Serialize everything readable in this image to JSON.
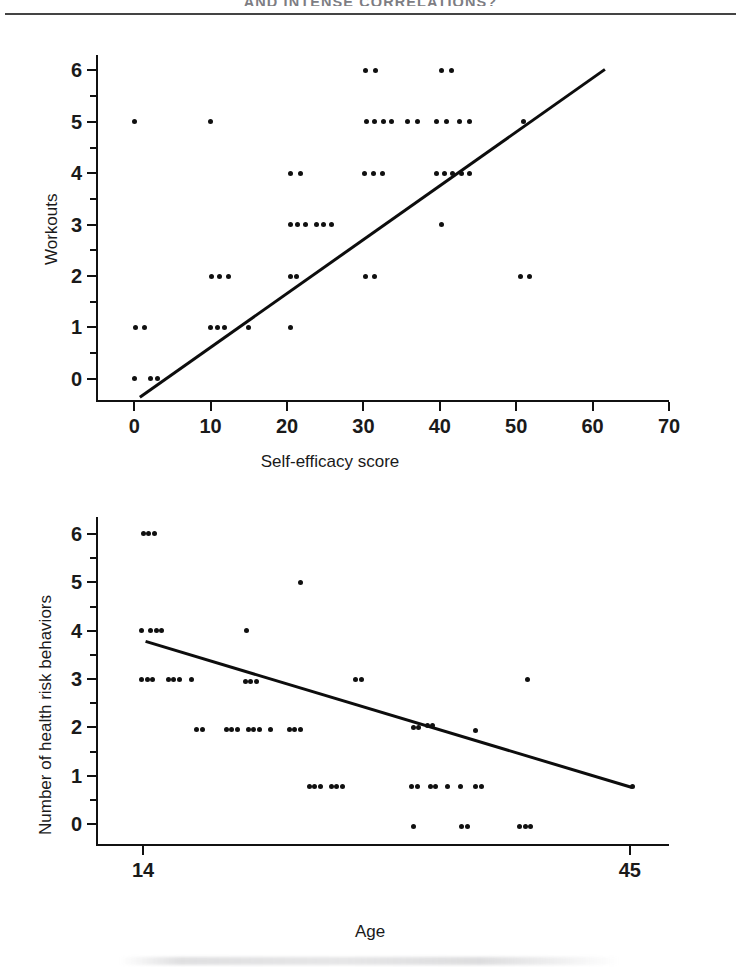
{
  "page": {
    "running_head": "AND INTENSE CORRELATIONS?",
    "background_color": "#ffffff",
    "ink_color": "#101010"
  },
  "chart_data": [
    {
      "id": "workouts-vs-self-efficacy",
      "type": "scatter",
      "title": "",
      "xlabel": "Self-efficacy score",
      "ylabel": "Workouts",
      "xlim": [
        -5,
        70
      ],
      "ylim": [
        -0.45,
        6.3
      ],
      "xticks": [
        0,
        10,
        20,
        30,
        40,
        50,
        60,
        70
      ],
      "yticks": [
        0,
        1,
        2,
        3,
        4,
        5,
        6
      ],
      "y_minor_ticks": [
        0.5,
        1.5,
        2.5,
        3.5,
        4.5,
        5.5
      ],
      "grid": false,
      "legend": false,
      "relationship": "positive",
      "trendline": {
        "type": "linear",
        "x_start": 0.6,
        "y_start": -0.33,
        "x_end": 61.5,
        "y_end": 6.05
      },
      "points": [
        {
          "x": 0,
          "y": 5
        },
        {
          "x": 10,
          "y": 5
        },
        {
          "x": 30.3,
          "y": 6
        },
        {
          "x": 31.6,
          "y": 6
        },
        {
          "x": 40.2,
          "y": 6
        },
        {
          "x": 41.5,
          "y": 6
        },
        {
          "x": 30.4,
          "y": 5
        },
        {
          "x": 31.5,
          "y": 5
        },
        {
          "x": 32.6,
          "y": 5
        },
        {
          "x": 33.7,
          "y": 5
        },
        {
          "x": 35.8,
          "y": 5
        },
        {
          "x": 37.1,
          "y": 5
        },
        {
          "x": 39.6,
          "y": 5
        },
        {
          "x": 40.9,
          "y": 5
        },
        {
          "x": 42.6,
          "y": 5
        },
        {
          "x": 43.9,
          "y": 5
        },
        {
          "x": 51.0,
          "y": 5
        },
        {
          "x": 20.5,
          "y": 4
        },
        {
          "x": 21.8,
          "y": 4
        },
        {
          "x": 30.2,
          "y": 4
        },
        {
          "x": 31.3,
          "y": 4
        },
        {
          "x": 32.5,
          "y": 4
        },
        {
          "x": 39.6,
          "y": 4
        },
        {
          "x": 40.6,
          "y": 4
        },
        {
          "x": 41.6,
          "y": 4
        },
        {
          "x": 42.9,
          "y": 4
        },
        {
          "x": 43.9,
          "y": 4
        },
        {
          "x": 20.4,
          "y": 3
        },
        {
          "x": 21.4,
          "y": 3
        },
        {
          "x": 22.4,
          "y": 3
        },
        {
          "x": 23.8,
          "y": 3
        },
        {
          "x": 24.8,
          "y": 3
        },
        {
          "x": 25.8,
          "y": 3
        },
        {
          "x": 40.2,
          "y": 3
        },
        {
          "x": 10.1,
          "y": 2
        },
        {
          "x": 11.2,
          "y": 2
        },
        {
          "x": 12.3,
          "y": 2
        },
        {
          "x": 20.4,
          "y": 2
        },
        {
          "x": 21.3,
          "y": 2
        },
        {
          "x": 30.3,
          "y": 2
        },
        {
          "x": 31.4,
          "y": 2
        },
        {
          "x": 50.6,
          "y": 2
        },
        {
          "x": 51.7,
          "y": 2
        },
        {
          "x": 0.2,
          "y": 1
        },
        {
          "x": 1.3,
          "y": 1
        },
        {
          "x": 10.0,
          "y": 1
        },
        {
          "x": 10.9,
          "y": 1
        },
        {
          "x": 11.8,
          "y": 1
        },
        {
          "x": 15.0,
          "y": 1
        },
        {
          "x": 20.5,
          "y": 1
        },
        {
          "x": 0.1,
          "y": 0
        },
        {
          "x": 2.1,
          "y": 0
        },
        {
          "x": 3.0,
          "y": 0
        }
      ]
    },
    {
      "id": "health-risk-behaviors-vs-age",
      "type": "scatter",
      "title": "",
      "xlabel": "Age",
      "ylabel": "Number of health risk behaviors",
      "xlim": [
        11.0,
        47.5
      ],
      "ylim": [
        -0.45,
        6.35
      ],
      "xticks": [
        14,
        45
      ],
      "yticks": [
        0,
        1,
        2,
        3,
        4,
        5,
        6
      ],
      "y_minor_ticks": [
        0.5,
        1.5,
        2.5,
        3.5,
        4.5,
        5.5
      ],
      "grid": false,
      "legend": false,
      "relationship": "negative",
      "trendline": {
        "type": "linear",
        "x_start": 14.2,
        "y_start": 3.8,
        "x_end": 45.2,
        "y_end": 0.78
      },
      "points": [
        {
          "x": 14.0,
          "y": 6
        },
        {
          "x": 14.35,
          "y": 6
        },
        {
          "x": 14.7,
          "y": 6
        },
        {
          "x": 24.0,
          "y": 5
        },
        {
          "x": 13.9,
          "y": 4
        },
        {
          "x": 14.5,
          "y": 4
        },
        {
          "x": 14.85,
          "y": 4
        },
        {
          "x": 15.2,
          "y": 4
        },
        {
          "x": 20.6,
          "y": 4
        },
        {
          "x": 13.9,
          "y": 3
        },
        {
          "x": 14.25,
          "y": 3
        },
        {
          "x": 14.6,
          "y": 3
        },
        {
          "x": 15.6,
          "y": 3
        },
        {
          "x": 15.95,
          "y": 3
        },
        {
          "x": 16.3,
          "y": 3
        },
        {
          "x": 17.1,
          "y": 3
        },
        {
          "x": 20.5,
          "y": 2.95
        },
        {
          "x": 20.85,
          "y": 2.95
        },
        {
          "x": 21.2,
          "y": 2.95
        },
        {
          "x": 27.5,
          "y": 3
        },
        {
          "x": 27.9,
          "y": 3
        },
        {
          "x": 38.5,
          "y": 3
        },
        {
          "x": 17.4,
          "y": 1.95
        },
        {
          "x": 17.8,
          "y": 1.95
        },
        {
          "x": 19.3,
          "y": 1.95
        },
        {
          "x": 19.65,
          "y": 1.95
        },
        {
          "x": 20.0,
          "y": 1.95
        },
        {
          "x": 20.7,
          "y": 1.95
        },
        {
          "x": 21.05,
          "y": 1.95
        },
        {
          "x": 21.4,
          "y": 1.95
        },
        {
          "x": 22.1,
          "y": 1.95
        },
        {
          "x": 23.3,
          "y": 1.95
        },
        {
          "x": 23.65,
          "y": 1.95
        },
        {
          "x": 24.0,
          "y": 1.95
        },
        {
          "x": 31.2,
          "y": 2.0
        },
        {
          "x": 31.55,
          "y": 2.0
        },
        {
          "x": 32.1,
          "y": 2.05
        },
        {
          "x": 32.45,
          "y": 2.05
        },
        {
          "x": 35.2,
          "y": 1.93
        },
        {
          "x": 24.6,
          "y": 0.78
        },
        {
          "x": 24.95,
          "y": 0.78
        },
        {
          "x": 25.3,
          "y": 0.78
        },
        {
          "x": 26.0,
          "y": 0.78
        },
        {
          "x": 26.35,
          "y": 0.78
        },
        {
          "x": 26.7,
          "y": 0.78
        },
        {
          "x": 31.1,
          "y": 0.78
        },
        {
          "x": 31.45,
          "y": 0.78
        },
        {
          "x": 32.3,
          "y": 0.78
        },
        {
          "x": 32.65,
          "y": 0.78
        },
        {
          "x": 33.4,
          "y": 0.78
        },
        {
          "x": 34.2,
          "y": 0.78
        },
        {
          "x": 35.2,
          "y": 0.78
        },
        {
          "x": 35.55,
          "y": 0.78
        },
        {
          "x": 45.2,
          "y": 0.78
        },
        {
          "x": 31.2,
          "y": -0.05
        },
        {
          "x": 34.3,
          "y": -0.05
        },
        {
          "x": 34.65,
          "y": -0.05
        },
        {
          "x": 38.0,
          "y": -0.05
        },
        {
          "x": 38.35,
          "y": -0.05
        },
        {
          "x": 38.7,
          "y": -0.05
        }
      ]
    }
  ]
}
